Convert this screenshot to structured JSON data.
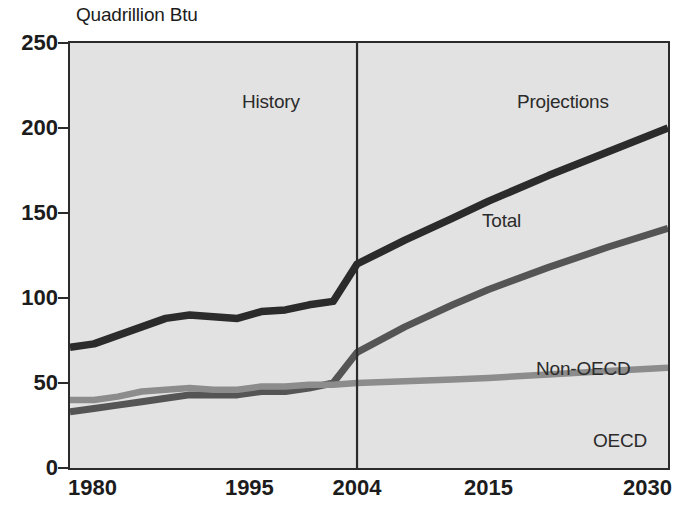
{
  "chart_data": {
    "type": "line",
    "title": "",
    "ylabel": "Quadrillion Btu",
    "xlabel": "",
    "ylim": [
      0,
      250
    ],
    "xlim": [
      1980,
      2030
    ],
    "yticks": [
      0,
      50,
      100,
      150,
      200,
      250
    ],
    "xticks": [
      1980,
      1995,
      2004,
      2015,
      2030
    ],
    "ytick_labels": [
      "0",
      "50",
      "100",
      "150",
      "200",
      "250"
    ],
    "xtick_labels": [
      "1980",
      "1995",
      "2004",
      "2015",
      "2030"
    ],
    "grid": false,
    "legend": "inline-labels",
    "history_projection_split": 2004,
    "annotations": [
      {
        "text": "History",
        "x": 1990,
        "y": 238
      },
      {
        "text": "Projections",
        "x": 2017,
        "y": 238
      },
      {
        "text": "Total",
        "x": 2009,
        "y": 178
      },
      {
        "text": "Non-OECD",
        "x": 2013,
        "y": 92
      },
      {
        "text": "OECD",
        "x": 2018,
        "y": 50
      }
    ],
    "series": [
      {
        "name": "Total",
        "color": "#2b2b2b",
        "x": [
          1980,
          1982,
          1984,
          1986,
          1988,
          1990,
          1992,
          1994,
          1996,
          1998,
          2000,
          2002,
          2004,
          2008,
          2012,
          2015,
          2020,
          2025,
          2030
        ],
        "values": [
          71,
          73,
          78,
          83,
          88,
          90,
          89,
          88,
          92,
          93,
          96,
          98,
          120,
          134,
          147,
          157,
          172,
          186,
          200
        ]
      },
      {
        "name": "Non-OECD",
        "color": "#555555",
        "x": [
          1980,
          1982,
          1984,
          1986,
          1988,
          1990,
          1992,
          1994,
          1996,
          1998,
          2000,
          2002,
          2004,
          2008,
          2012,
          2015,
          2020,
          2025,
          2030
        ],
        "values": [
          33,
          35,
          37,
          39,
          41,
          43,
          43,
          43,
          45,
          45,
          47,
          50,
          68,
          83,
          96,
          105,
          118,
          130,
          141
        ]
      },
      {
        "name": "OECD",
        "color": "#8c8c8c",
        "x": [
          1980,
          1982,
          1984,
          1986,
          1988,
          1990,
          1992,
          1994,
          1996,
          1998,
          2000,
          2002,
          2004,
          2008,
          2012,
          2015,
          2020,
          2025,
          2030
        ],
        "values": [
          40,
          40,
          42,
          45,
          46,
          47,
          46,
          46,
          48,
          48,
          49,
          49,
          50,
          51,
          52,
          53,
          55,
          57,
          59
        ]
      }
    ]
  },
  "axis": {
    "y_title": "Quadrillion Btu"
  },
  "annotations": {
    "history": "History",
    "projections": "Projections",
    "total": "Total",
    "non_oecd": "Non-OECD",
    "oecd": "OECD"
  },
  "ticks": {
    "y": [
      "250",
      "200",
      "150",
      "100",
      "50",
      "0"
    ],
    "x": [
      "1980",
      "1995",
      "2004",
      "2015",
      "2030"
    ]
  },
  "colors": {
    "plot_background": "#e2e2e2",
    "frame": "#2b2b2b",
    "total": "#2b2b2b",
    "non_oecd": "#555555",
    "oecd": "#8c8c8c",
    "text": "#1c1c1c"
  }
}
